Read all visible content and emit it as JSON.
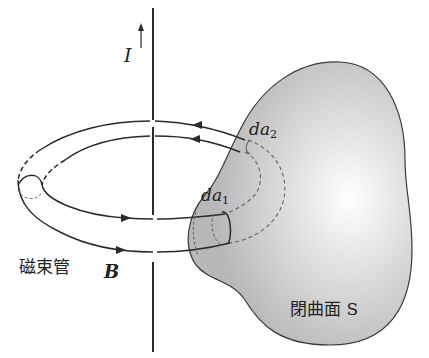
{
  "diagram": {
    "labels": {
      "current": "I",
      "da2_main": "da",
      "da2_sub": "2",
      "da1_main": "da",
      "da1_sub": "1",
      "flux_tube": "磁束管",
      "field": "B",
      "surface": "閉曲面 S"
    },
    "colors": {
      "line": "#2a2a2a",
      "surface_fill": "#c4c4c4",
      "surface_highlight": "#ffffff",
      "dashed": "#666666"
    }
  }
}
